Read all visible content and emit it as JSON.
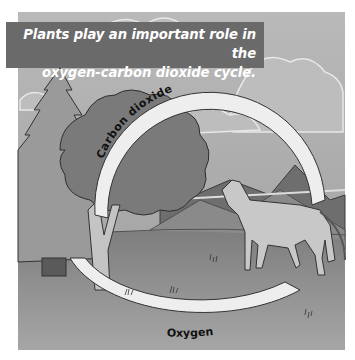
{
  "figure": {
    "title_lines": [
      "Plants play an important role in the",
      "oxygen-carbon dioxide cycle."
    ],
    "labels": {
      "top_arrow": "Carbon dioxide",
      "bottom_arrow": "Oxygen"
    },
    "elements": [
      "sky-with-clouds",
      "mountains",
      "pine-tree",
      "deciduous-tree",
      "horse",
      "grass-ground",
      "cycle-arrows"
    ],
    "colors": {
      "banner_bg": "#6a6a6a",
      "banner_text": "#ffffff",
      "sky": "#a9a9a9",
      "ground": "#8c8c8c",
      "arrow_fill": "#eeeeee",
      "outline": "#333333"
    }
  }
}
